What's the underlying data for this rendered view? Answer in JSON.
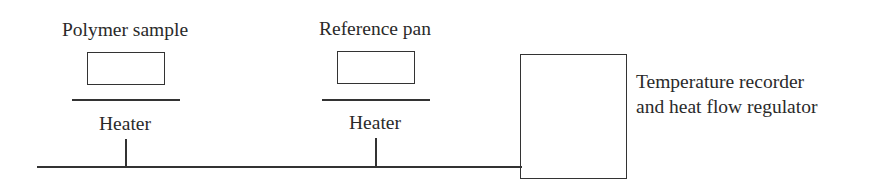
{
  "diagram": {
    "type": "schematic",
    "components": {
      "sample": {
        "label": "Polymer sample",
        "heater_label": "Heater"
      },
      "reference": {
        "label": "Reference pan",
        "heater_label": "Heater"
      },
      "controller": {
        "label_line1": "Temperature recorder",
        "label_line2": "and heat flow regulator"
      }
    },
    "connections": [
      {
        "from": "sample-heater",
        "to": "controller"
      },
      {
        "from": "reference-heater",
        "to": "controller"
      }
    ],
    "colors": {
      "stroke": "#333333",
      "text": "#2a2a2a",
      "background": "#ffffff"
    }
  }
}
